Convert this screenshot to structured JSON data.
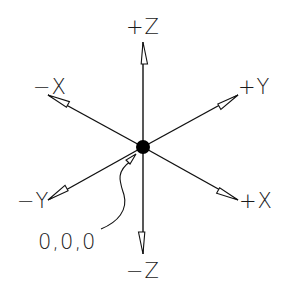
{
  "diagram": {
    "origin_label": "0,0,0",
    "axes": [
      {
        "id": "plus-z",
        "label": "+Z"
      },
      {
        "id": "minus-z",
        "label": "−Z"
      },
      {
        "id": "minus-x",
        "label": "−X"
      },
      {
        "id": "plus-x",
        "label": "+X"
      },
      {
        "id": "plus-y",
        "label": "+Y"
      },
      {
        "id": "minus-y",
        "label": "−Y"
      }
    ],
    "colors": {
      "line": "#111111",
      "background": "#ffffff",
      "origin_dot": "#000000"
    }
  }
}
